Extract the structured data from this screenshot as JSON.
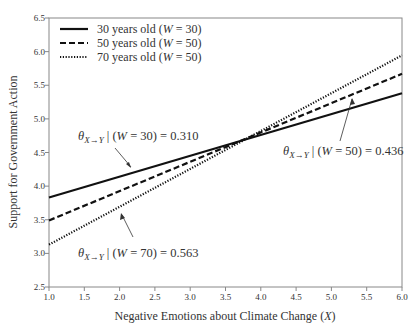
{
  "chart_data": {
    "type": "line",
    "title": "",
    "xlabel": "Negative Emotions about Climate Change (X)",
    "ylabel": "Support for Government Action",
    "xlim": [
      1.0,
      6.0
    ],
    "ylim": [
      2.5,
      6.5
    ],
    "x_ticks": [
      "1.0",
      "1.5",
      "2.0",
      "2.5",
      "3.0",
      "3.5",
      "4.0",
      "4.5",
      "5.0",
      "5.5",
      "6.0"
    ],
    "y_ticks": [
      "2.5",
      "3.0",
      "3.5",
      "4.0",
      "4.5",
      "5.0",
      "5.5",
      "6.0",
      "6.5"
    ],
    "grid": false,
    "legend_position": "upper-left",
    "x": [
      1.0,
      6.0
    ],
    "series": [
      {
        "name": "30 years old (W = 30)",
        "style": "solid",
        "values": [
          3.83,
          5.38
        ],
        "slope": 0.31
      },
      {
        "name": "50 years old (W = 50)",
        "style": "dashed",
        "values": [
          3.49,
          5.67
        ],
        "slope": 0.436
      },
      {
        "name": "70 years old (W = 50)",
        "style": "dotted",
        "values": [
          3.13,
          5.945
        ],
        "slope": 0.563
      }
    ],
    "annotations": [
      {
        "text": "θX→Y | (W = 30) = 0.310",
        "target_series": 0
      },
      {
        "text": "θX→Y | (W = 50) = 0.436",
        "target_series": 1
      },
      {
        "text": "θX→Y | (W = 70) = 0.563",
        "target_series": 2
      }
    ]
  },
  "legend": [
    {
      "label_pre": "30 years old (",
      "var": "W",
      "label_post": " = 30)"
    },
    {
      "label_pre": "50 years old (",
      "var": "W",
      "label_post": " = 50)"
    },
    {
      "label_pre": "70 years old (",
      "var": "W",
      "label_post": " = 50)"
    }
  ],
  "annotations": [
    {
      "theta": "θ",
      "sub": "X→Y",
      "mid": " | (",
      "var": "W",
      "rest": " = 30) = 0.310"
    },
    {
      "theta": "θ",
      "sub": "X→Y",
      "mid": " | (",
      "var": "W",
      "rest": " = 50) = 0.436"
    },
    {
      "theta": "θ",
      "sub": "X→Y",
      "mid": " | (",
      "var": "W",
      "rest": " = 70) = 0.563"
    }
  ],
  "axis": {
    "xlabel_pre": "Negative Emotions about Climate Change (",
    "xlabel_var": "X",
    "xlabel_post": ")",
    "ylabel": "Support for Government Action"
  }
}
